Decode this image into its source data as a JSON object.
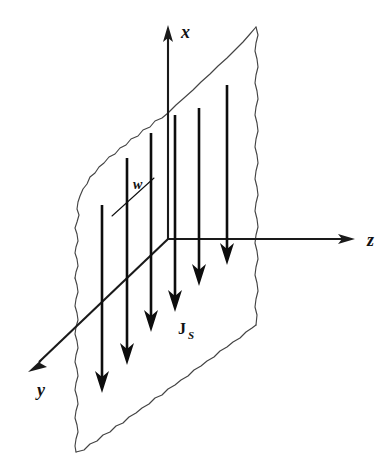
{
  "figure": {
    "title": "Infinite current sheet in the x-y plane carrying surface current density J_S",
    "type": "physics-vector-diagram",
    "background_color": "#ffffff",
    "ink_color": "#111111",
    "sheet_edge_color": "#444444"
  },
  "axes": [
    {
      "id": "x",
      "label": "x",
      "direction": "up",
      "origin": {
        "x": 168,
        "y": 239
      },
      "tip": {
        "x": 168,
        "y": 27
      },
      "label_pos": {
        "x": 181,
        "y": 38
      }
    },
    {
      "id": "y",
      "label": "y",
      "direction": "down-left (out of page)",
      "origin": {
        "x": 168,
        "y": 239
      },
      "tip": {
        "x": 29,
        "y": 371
      },
      "label_pos": {
        "x": 37,
        "y": 396
      }
    },
    {
      "id": "z",
      "label": "z",
      "direction": "right",
      "origin": {
        "x": 168,
        "y": 239
      },
      "tip": {
        "x": 354,
        "y": 239
      },
      "label_pos": {
        "x": 367,
        "y": 246
      }
    }
  ],
  "sheet": {
    "name": "current-sheet",
    "description": "wavy-edged parallelogram representing an infinite conducting sheet lying in the x-y plane",
    "corners": [
      {
        "x": 168,
        "y": 113
      },
      {
        "x": 256,
        "y": 27
      },
      {
        "x": 256,
        "y": 325
      },
      {
        "x": 76,
        "y": 452
      }
    ]
  },
  "width_marker": {
    "label": "w",
    "label_pos": {
      "x": 133,
      "y": 189
    },
    "line_start": {
      "x": 112,
      "y": 216
    },
    "line_end": {
      "x": 154,
      "y": 178
    }
  },
  "current_label": {
    "symbol": "J",
    "subscript": "S",
    "full": "JS",
    "pos": {
      "x": 178,
      "y": 334
    }
  },
  "current_arrows": {
    "count": 6,
    "direction": "negative x (downward, parallel to sheet)",
    "arrows": [
      {
        "index": 1,
        "x": 102,
        "top_y": 205,
        "tip_y": 392
      },
      {
        "index": 2,
        "x": 127,
        "top_y": 158,
        "tip_y": 364
      },
      {
        "index": 3,
        "x": 151,
        "top_y": 133,
        "tip_y": 331
      },
      {
        "index": 4,
        "x": 175,
        "top_y": 115,
        "tip_y": 311
      },
      {
        "index": 5,
        "x": 199,
        "top_y": 108,
        "tip_y": 285
      },
      {
        "index": 6,
        "x": 227,
        "top_y": 85,
        "tip_y": 264
      }
    ]
  }
}
